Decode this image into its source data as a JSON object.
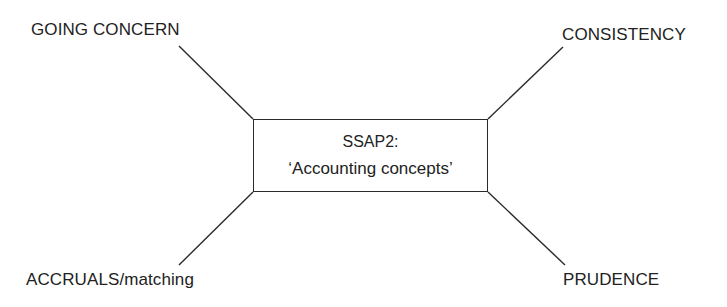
{
  "diagram": {
    "center": {
      "title": "SSAP2:",
      "subtitle": "‘Accounting concepts’"
    },
    "concepts": {
      "top_left": "GOING CONCERN",
      "top_right": "CONSISTENCY",
      "bottom_left": "ACCRUALS/matching",
      "bottom_right": "PRUDENCE"
    },
    "colors": {
      "line": "#2a2a2a",
      "text": "#222222",
      "background": "#ffffff"
    }
  }
}
